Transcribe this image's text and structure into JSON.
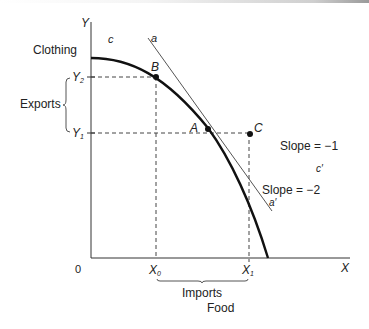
{
  "diagram": {
    "type": "production-possibility-frontier",
    "axes": {
      "y_label": "Y",
      "y_title": "Clothing",
      "x_label": "X",
      "x_title": "Food",
      "origin": "0"
    },
    "ticks": {
      "y_upper": "Y",
      "y_upper_sub": "2",
      "y_lower": "Y",
      "y_lower_sub": "1",
      "x_left": "X",
      "x_left_sub": "0",
      "x_right": "X",
      "x_right_sub": "1"
    },
    "points": {
      "A": "A",
      "B": "B",
      "C": "C"
    },
    "curve_labels": {
      "c": "c",
      "c_prime": "c′",
      "a": "a",
      "a_prime": "a′"
    },
    "braces": {
      "exports": "Exports",
      "imports": "Imports"
    },
    "slopes": {
      "world_price": "Slope = −1",
      "domestic": "Slope = −2"
    },
    "colors": {
      "ink": "#111111",
      "thin_line": "#555555",
      "dashed": "#444444"
    }
  }
}
